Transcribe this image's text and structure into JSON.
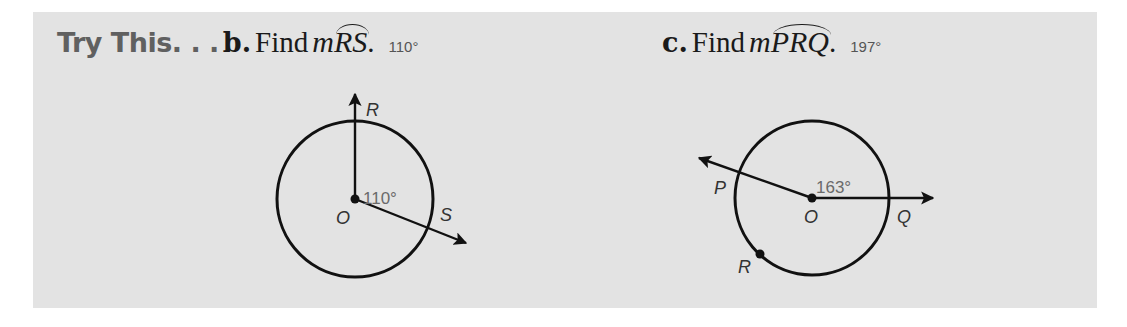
{
  "section": {
    "title": "Try This. . .",
    "colors": {
      "panel_bg": "#e3e3e3",
      "title": "#606060",
      "ink": "#1a1a1a",
      "answer": "#555555"
    }
  },
  "exercises": [
    {
      "letter": "b.",
      "prompt": "Find",
      "measure_symbol": "m",
      "arc": "RS",
      "terminator": ".",
      "answer": "110°",
      "figure": {
        "center_label": "O",
        "angle_label": "110°",
        "points": [
          "R",
          "S"
        ],
        "central_angle_deg": 110
      }
    },
    {
      "letter": "c.",
      "prompt": "Find",
      "measure_symbol": "m",
      "arc": "PRQ",
      "terminator": ".",
      "answer": "197°",
      "figure": {
        "center_label": "O",
        "angle_label": "163°",
        "points": [
          "P",
          "R",
          "Q"
        ],
        "central_angle_deg": 163
      }
    }
  ]
}
